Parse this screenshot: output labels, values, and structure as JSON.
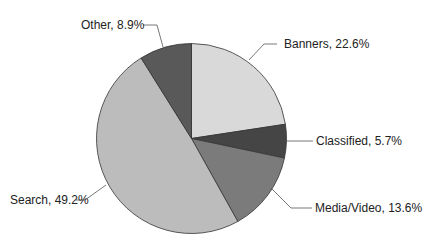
{
  "chart_data": {
    "type": "pie",
    "title": "",
    "categories": [
      "Banners",
      "Classified",
      "Media/Video",
      "Search",
      "Other"
    ],
    "values": [
      22.6,
      5.7,
      13.6,
      49.2,
      8.9
    ],
    "unit": "%",
    "start_angle_deg": 0,
    "direction": "clockwise",
    "colors": [
      "#d9d9d9",
      "#454545",
      "#7b7b7b",
      "#bcbcbc",
      "#595959"
    ],
    "labels": [
      "Banners, 22.6%",
      "Classified, 5.7%",
      "Media/Video, 13.6%",
      "Search, 49.2%",
      "Other, 8.9%"
    ],
    "legend": "none (leader-line labels)"
  }
}
